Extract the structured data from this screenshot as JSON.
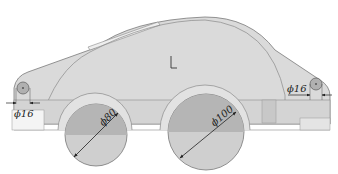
{
  "diagram": {
    "type": "technical-drawing",
    "colors": {
      "body_fill": "#d9d9d9",
      "outline": "#7a7a7a",
      "wheel_dark": "#b3b3b3",
      "wheel_light": "#cfcfcf",
      "background": "#ffffff",
      "dimension": "#222222"
    },
    "dimensions": {
      "left_pin": "ϕ16",
      "right_pin": "ϕ16",
      "front_wheel": "ϕ80",
      "rear_wheel": "ϕ100"
    }
  }
}
